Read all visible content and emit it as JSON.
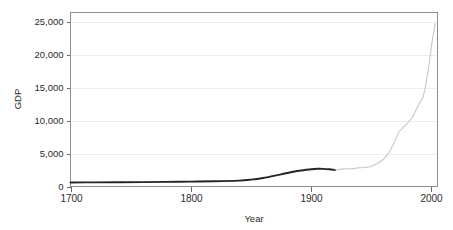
{
  "figure": {
    "background_color": "#ffffff",
    "frame_color": "#8e8e8e",
    "grid_color": "#e8e8e8",
    "top_clipped_artifact": ""
  },
  "chart_data": {
    "type": "line",
    "title": "",
    "xlabel": "Year",
    "ylabel": "GDP",
    "xlim": [
      1700,
      2005
    ],
    "ylim": [
      0,
      26500
    ],
    "grid": "horizontal",
    "legend": "none",
    "xticks": [
      1700,
      1800,
      1900,
      2000
    ],
    "xtick_labels": [
      "1700",
      "1800",
      "1900",
      "2000"
    ],
    "yticks": [
      0,
      5000,
      10000,
      15000,
      20000,
      25000
    ],
    "ytick_labels": [
      "0",
      "5,000",
      "10,000",
      "15,000",
      "20,000",
      "25,000"
    ],
    "series": [
      {
        "name": "historic-estimate",
        "style": "solid-thick-dark",
        "color": "#242424",
        "x": [
          1700,
          1720,
          1740,
          1760,
          1780,
          1800,
          1820,
          1840,
          1850,
          1860,
          1870,
          1880,
          1890,
          1900,
          1905,
          1910,
          1915,
          1920
        ],
        "values": [
          620,
          630,
          650,
          670,
          700,
          740,
          790,
          900,
          1050,
          1300,
          1650,
          2050,
          2400,
          2620,
          2700,
          2690,
          2620,
          2500
        ]
      },
      {
        "name": "modern-series",
        "style": "solid-thin-light",
        "color": "#c6c6c6",
        "x": [
          1920,
          1925,
          1930,
          1935,
          1940,
          1945,
          1950,
          1955,
          1960,
          1965,
          1970,
          1973,
          1975,
          1980,
          1985,
          1990,
          1993,
          1995,
          1998,
          2000,
          2001,
          2002,
          2003
        ],
        "values": [
          2500,
          2650,
          2700,
          2720,
          2850,
          2900,
          3050,
          3500,
          4100,
          5200,
          7100,
          8400,
          8700,
          9600,
          10800,
          12700,
          13600,
          15200,
          18500,
          21500,
          22600,
          23600,
          24800
        ]
      }
    ]
  }
}
